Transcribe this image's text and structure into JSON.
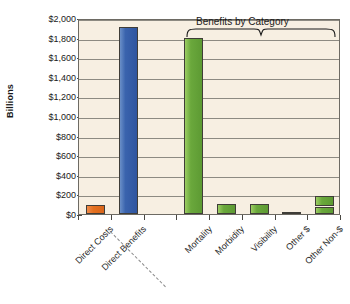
{
  "chart_data": {
    "type": "bar",
    "title": "",
    "xlabel": "",
    "ylabel": "Billions",
    "ylim": [
      0,
      2000
    ],
    "ytick_labels": [
      "$2,000",
      "$1,800",
      "$1,600",
      "$1,400",
      "$1,200",
      "$1,000",
      "$800",
      "$600",
      "$400",
      "$200",
      "$0"
    ],
    "ytick_values": [
      2000,
      1800,
      1600,
      1400,
      1200,
      1000,
      800,
      600,
      400,
      200,
      0
    ],
    "grid": true,
    "legend": "none",
    "categories": [
      "Direct Costs",
      "Direct Benefits",
      "",
      "Mortality",
      "Morbidity",
      "Visibility",
      "Other $",
      "Other Non-$"
    ],
    "values": [
      90,
      1910,
      null,
      1800,
      100,
      100,
      25,
      180
    ],
    "colors": [
      "#e4701f",
      "#3a63ad",
      "",
      "#6aa83c",
      "#6aa83c",
      "#6aa83c",
      "#6aa83c",
      "#6aa83c"
    ],
    "series": [
      {
        "name": "Costs and Benefits",
        "points": [
          {
            "category": "Direct Costs",
            "value": 90,
            "color": "#e4701f"
          },
          {
            "category": "Direct Benefits",
            "value": 1910,
            "color": "#3a63ad"
          },
          {
            "category": "Mortality",
            "value": 1800,
            "color": "#6aa83c"
          },
          {
            "category": "Morbidity",
            "value": 100,
            "color": "#6aa83c"
          },
          {
            "category": "Visibility",
            "value": 100,
            "color": "#6aa83c"
          },
          {
            "category": "Other $",
            "value": 25,
            "color": "#6aa83c"
          },
          {
            "category": "Other Non-$",
            "value": 180,
            "color": "#6aa83c",
            "segments": [
              70,
              110
            ]
          }
        ]
      }
    ],
    "annotations": [
      {
        "name": "group-bracket",
        "text": "Benefits by Category",
        "spans": [
          "Mortality",
          "Other Non-$"
        ]
      },
      {
        "name": "group-separator",
        "text": "",
        "style": "dashed-diagonal"
      }
    ],
    "plot_background": "#f7efe2",
    "accent_orange": "#e4701f",
    "accent_blue": "#3a63ad",
    "accent_green": "#6aa83c"
  },
  "axis": {
    "y_title": "Billions"
  },
  "annotation": {
    "bracket_label": "Benefits by Category"
  },
  "ticks": {
    "labels": [
      "$2,000",
      "$1,800",
      "$1,600",
      "$1,400",
      "$1,200",
      "$1,000",
      "$800",
      "$600",
      "$400",
      "$200",
      "$0"
    ]
  },
  "xlabels": [
    "Direct Costs",
    "Direct Benefits",
    "Mortality",
    "Morbidity",
    "Visibility",
    "Other $",
    "Other Non-$"
  ]
}
